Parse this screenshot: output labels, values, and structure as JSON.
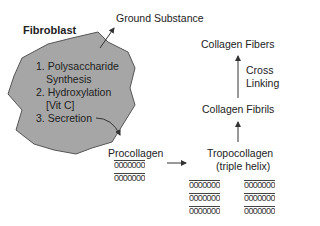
{
  "diagram": {
    "cell": {
      "title": "Fibroblast",
      "fill_color": "#a6a6a6",
      "steps": [
        "1. Polysaccharide",
        "Synthesis",
        "2. Hydroxylation",
        "[Vit C]",
        "3. Secretion"
      ]
    },
    "outputs": {
      "ground_substance": "Ground Substance",
      "procollagen": "Procollagen",
      "tropocollagen": "Tropocollagen",
      "triple_helix": "(triple helix)",
      "collagen_fibrils": "Collagen Fibrils",
      "cross_linking_1": "Cross",
      "cross_linking_2": "Linking",
      "collagen_fibers": "Collagen Fibers"
    },
    "helix_glyph": "0000000",
    "arrow_color": "#333333"
  }
}
